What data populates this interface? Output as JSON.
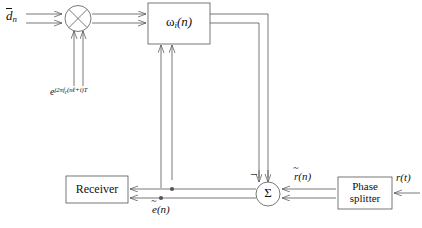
{
  "diagram": {
    "stroke_color": "#555555",
    "text_color": "#111111",
    "background": "#ffffff"
  },
  "signals": {
    "input_data": "d",
    "input_data_sub": "n",
    "carrier": "e",
    "carrier_exponent_prefix": "j2πf",
    "carrier_exponent_sub": "c",
    "carrier_exponent_rest": "(nℓ+i)T",
    "error": "e",
    "error_arg": "(n)",
    "received": "r",
    "received_arg": "(n)",
    "analog_input": "r",
    "analog_input_arg": "(t)",
    "minus_sign": "−"
  },
  "blocks": {
    "multiplier": {
      "name": "multiplier",
      "glyph": "×"
    },
    "filter": {
      "name": "adaptive-filter",
      "symbol": "ω",
      "sub": "i",
      "arg": "(n)"
    },
    "summer": {
      "name": "summing-junction",
      "glyph": "Σ"
    },
    "receiver": {
      "name": "receiver",
      "label": "Receiver"
    },
    "phase_splitter": {
      "name": "phase-splitter",
      "line1": "Phase",
      "line2": "splitter"
    }
  }
}
